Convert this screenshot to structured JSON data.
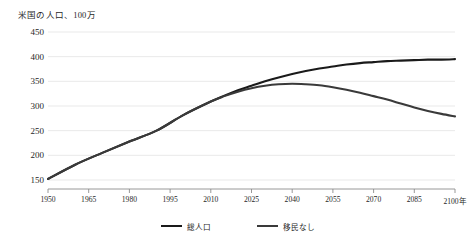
{
  "chart_data": {
    "type": "line",
    "title": "米国の人口、100万",
    "xlabel": "",
    "ylabel": "",
    "xlim": [
      1950,
      2100
    ],
    "ylim": [
      150,
      450
    ],
    "grid": true,
    "legend_position": "bottom",
    "xticks": [
      "1950",
      "1965",
      "1980",
      "1995",
      "2010",
      "2025",
      "2040",
      "2055",
      "2070",
      "2085",
      "2100年"
    ],
    "xtick_values": [
      1950,
      1965,
      1980,
      1995,
      2010,
      2025,
      2040,
      2055,
      2070,
      2085,
      2100
    ],
    "yticks": [
      "150",
      "200",
      "250",
      "300",
      "350",
      "400",
      "450"
    ],
    "ytick_values": [
      150,
      200,
      250,
      300,
      350,
      400,
      450
    ],
    "x": [
      1950,
      1960,
      1970,
      1980,
      1990,
      2000,
      2010,
      2015,
      2020,
      2025,
      2030,
      2035,
      2040,
      2045,
      2050,
      2055,
      2060,
      2065,
      2070,
      2075,
      2080,
      2085,
      2090,
      2095,
      2100
    ],
    "series": [
      {
        "name": "総人口",
        "color": "#1a1a1a",
        "values": [
          152,
          181,
          205,
          228,
          250,
          282,
          309,
          321,
          332,
          341,
          350,
          358,
          365,
          371,
          376,
          380,
          384,
          387,
          389,
          391,
          392,
          393,
          394,
          394,
          395
        ]
      },
      {
        "name": "移民なし",
        "color": "#3a3a3a",
        "values": [
          152,
          181,
          205,
          228,
          250,
          282,
          309,
          320,
          329,
          336,
          341,
          344,
          345,
          344,
          342,
          338,
          333,
          327,
          320,
          313,
          305,
          297,
          290,
          284,
          279
        ]
      }
    ]
  }
}
